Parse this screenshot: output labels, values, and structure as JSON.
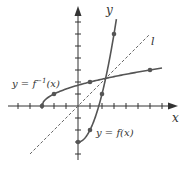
{
  "diagram": {
    "title": "",
    "axes": {
      "x_label": "x",
      "y_label": "y",
      "origin_px": [
        78,
        106
      ],
      "unit_px": 12,
      "x_range": [
        -5,
        7
      ],
      "y_range": [
        -4,
        7
      ]
    },
    "curves": [
      {
        "name": "f",
        "label": "y = f(x)",
        "equation": "x^2 - 3",
        "domain": [
          0,
          3.2
        ],
        "points": [
          [
            0,
            -3
          ],
          [
            1,
            -2
          ],
          [
            2,
            1
          ],
          [
            3,
            6
          ]
        ],
        "color": "#555555"
      },
      {
        "name": "f-inverse",
        "label_prefix": "y = f",
        "label_sup": "−1",
        "label_suffix": "(x)",
        "equation": "sqrt(x + 3)",
        "domain": [
          -3,
          7
        ],
        "points": [
          [
            -3,
            0
          ],
          [
            -2,
            1
          ],
          [
            1,
            2
          ],
          [
            6,
            3
          ]
        ],
        "color": "#555555"
      }
    ],
    "line_l": {
      "label": "l",
      "equation": "y = x",
      "from": [
        -4,
        -4
      ],
      "to": [
        6,
        6
      ],
      "style": "dashed",
      "color": "#666666"
    },
    "colors": {
      "axis": "#333333",
      "curve": "#555555",
      "point": "#555555",
      "text": "#333333"
    }
  }
}
